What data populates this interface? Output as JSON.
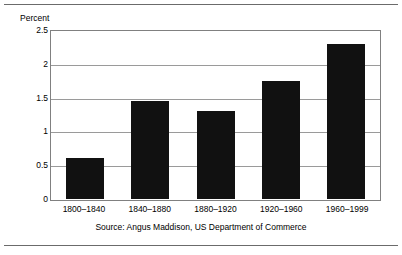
{
  "chart_data": {
    "type": "bar",
    "title": "",
    "subtitle": "",
    "xlabel": "",
    "ylabel": "Percent",
    "categories": [
      "1800–1840",
      "1840–1880",
      "1880–1920",
      "1920–1960",
      "1960–1999"
    ],
    "values": [
      0.6,
      1.45,
      1.3,
      1.75,
      2.3
    ],
    "series": [
      {
        "name": "Percent",
        "values": [
          0.6,
          1.45,
          1.3,
          1.75,
          2.3
        ]
      }
    ],
    "ylim": [
      0,
      2.5
    ],
    "ytick_labels": [
      "0",
      "0.5",
      "1",
      "1.5",
      "2",
      "2.5"
    ],
    "ytick_values": [
      0,
      0.5,
      1,
      1.5,
      2,
      2.5
    ],
    "grid": true,
    "legend": false,
    "legend_position": "none",
    "bar_color": "#111111",
    "grid_color": "#9a9a9a",
    "frame_color": "#808080",
    "annotations": [
      "Source: Angus Maddison, US Department of Commerce"
    ]
  },
  "figure": {
    "axis_title": "Percent",
    "source_note": "Source: Angus Maddison, US Department of Commerce"
  }
}
